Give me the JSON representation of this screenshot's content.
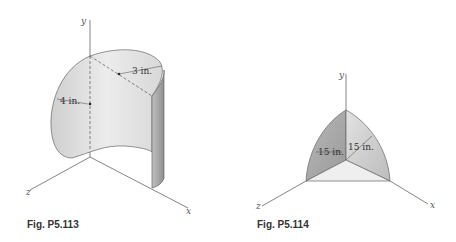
{
  "figures": [
    {
      "caption": "Fig. P5.113",
      "axes": {
        "x": "x",
        "y": "y",
        "z": "z"
      },
      "dimensions": {
        "height_label": "4 in.",
        "radius_label": "3 in."
      },
      "shape": "curved cylindrical shell (half-cylinder with elliptical cut top)"
    },
    {
      "caption": "Fig. P5.114",
      "axes": {
        "x": "x",
        "y": "y",
        "z": "z"
      },
      "dimensions": {
        "radius_label_1": "15 in.",
        "radius_label_2": "15 in."
      },
      "shape": "spherical octant shell"
    }
  ],
  "colors": {
    "surface_light": "#e6e6e6",
    "surface_mid": "#c8c8c8",
    "surface_dark": "#a8a8a8",
    "line": "#555555"
  }
}
